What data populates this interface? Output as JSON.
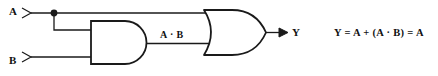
{
  "diagram": {
    "background_color": "#ffffff",
    "line_color": "#1a1a1a",
    "text_color": "#111111",
    "inputs": [
      {
        "id": "a",
        "label": "A",
        "marker": "input-arrow"
      },
      {
        "id": "b",
        "label": "B",
        "marker": "input-arrow"
      }
    ],
    "gates": [
      {
        "id": "and-gate",
        "type": "AND",
        "inputs": [
          "A",
          "B"
        ],
        "output_label": "A · B"
      },
      {
        "id": "or-gate",
        "type": "OR",
        "inputs": [
          "A",
          "A · B"
        ],
        "output_label": "Y"
      }
    ],
    "wires": {
      "junction_dot": "node-dot-a",
      "and_output_label": "A · B"
    },
    "output": {
      "id": "y",
      "label": "Y",
      "marker": "output-arrow"
    },
    "equation": "Y = A + (A · B) = A"
  }
}
